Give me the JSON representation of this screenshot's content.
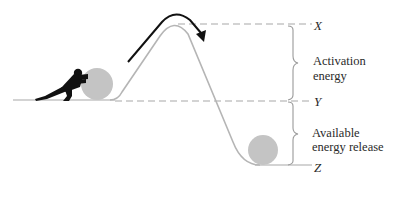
{
  "diagram": {
    "levels": {
      "x_label": "X",
      "y_label": "Y",
      "z_label": "Z"
    },
    "annotations": {
      "activation_line1": "Activation",
      "activation_line2": "energy",
      "release_line1": "Available",
      "release_line2": "energy release"
    },
    "colors": {
      "curve": "#b5b5b5",
      "dashed": "#a8a8a8",
      "arrow": "#111111",
      "ball": "#c4c4c4",
      "figure": "#111111",
      "text": "#2a2a2a"
    }
  }
}
